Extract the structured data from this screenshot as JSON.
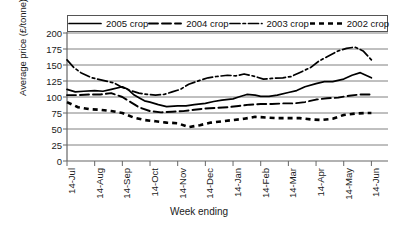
{
  "chart_data": {
    "type": "line",
    "title": "",
    "xlabel": "Week ending",
    "ylabel": "Average price (£/tonne)",
    "ylim": [
      0,
      200
    ],
    "yticks": [
      0,
      25,
      50,
      75,
      100,
      125,
      150,
      175,
      200
    ],
    "grid": true,
    "legend_position": "top",
    "categories": [
      "14-Jul",
      "14-Aug",
      "14-Sep",
      "14-Oct",
      "14-Nov",
      "14-Dec",
      "14-Jan",
      "14-Feb",
      "14-Mar",
      "14-Apr",
      "14-May",
      "14-Jun"
    ],
    "series": [
      {
        "name": "2005 crop",
        "style": "solid",
        "x": [
          0,
          0.3,
          0.6,
          1.0,
          1.3,
          1.6,
          2.0,
          2.2,
          2.4,
          2.6,
          2.8,
          3.0,
          3.3,
          3.6,
          4.0,
          4.3,
          4.6,
          5.0,
          5.3,
          5.6,
          6.0,
          6.2,
          6.5,
          6.8,
          7.0,
          7.3,
          7.6,
          8.0,
          8.3,
          8.6,
          9.0,
          9.3,
          9.6,
          10.0,
          10.3,
          10.6,
          11.0
        ],
        "values": [
          112,
          108,
          109,
          110,
          109,
          112,
          116,
          112,
          104,
          99,
          94,
          92,
          88,
          85,
          86,
          86,
          88,
          90,
          93,
          95,
          97,
          100,
          104,
          103,
          101,
          101,
          103,
          107,
          110,
          116,
          121,
          124,
          124,
          128,
          134,
          138,
          130
        ]
      },
      {
        "name": "2004 crop",
        "style": "dashed",
        "x": [
          0,
          0.4,
          0.8,
          1.2,
          1.6,
          2.0,
          2.3,
          2.6,
          3.0,
          3.4,
          3.8,
          4.2,
          4.6,
          5.0,
          5.4,
          5.8,
          6.2,
          6.6,
          7.0,
          7.4,
          7.8,
          8.2,
          8.6,
          9.0,
          9.4,
          9.8,
          10.2,
          10.6,
          11.0
        ],
        "values": [
          103,
          103,
          104,
          104,
          106,
          100,
          92,
          84,
          78,
          76,
          77,
          78,
          80,
          82,
          83,
          84,
          86,
          88,
          89,
          89,
          90,
          90,
          92,
          96,
          98,
          99,
          102,
          104,
          104
        ]
      },
      {
        "name": "2003 crop",
        "style": "dashdot",
        "x": [
          0,
          0.25,
          0.5,
          0.9,
          1.3,
          1.7,
          2.0,
          2.3,
          2.6,
          2.9,
          3.2,
          3.5,
          3.8,
          4.1,
          4.4,
          4.8,
          5.1,
          5.4,
          5.8,
          6.1,
          6.4,
          6.8,
          7.1,
          7.4,
          7.8,
          8.1,
          8.4,
          8.8,
          9.1,
          9.4,
          9.8,
          10.1,
          10.4,
          10.7,
          11.0
        ],
        "values": [
          158,
          146,
          138,
          130,
          126,
          122,
          115,
          110,
          106,
          104,
          103,
          104,
          108,
          112,
          120,
          126,
          130,
          132,
          134,
          133,
          136,
          132,
          128,
          129,
          130,
          132,
          138,
          146,
          156,
          163,
          172,
          176,
          178,
          172,
          158
        ]
      },
      {
        "name": "2002 crop",
        "style": "dotted",
        "x": [
          0,
          0.4,
          0.8,
          1.2,
          1.6,
          2.0,
          2.4,
          2.8,
          3.2,
          3.6,
          4.0,
          4.4,
          4.8,
          5.2,
          5.6,
          6.0,
          6.4,
          6.8,
          7.2,
          7.6,
          8.0,
          8.4,
          8.8,
          9.2,
          9.6,
          10.0,
          10.4,
          10.8,
          11.0
        ],
        "values": [
          92,
          84,
          81,
          80,
          78,
          75,
          68,
          64,
          62,
          60,
          59,
          53,
          56,
          60,
          62,
          64,
          66,
          69,
          68,
          67,
          67,
          67,
          65,
          64,
          66,
          72,
          74,
          75,
          75
        ]
      }
    ]
  },
  "legend": {
    "entries": [
      {
        "label": "2005 crop",
        "style": "solid"
      },
      {
        "label": "2004 crop",
        "style": "dashed"
      },
      {
        "label": "2003 crop",
        "style": "dashdot"
      },
      {
        "label": "2002 crop",
        "style": "dotted"
      }
    ]
  },
  "colors": {
    "line": "#000000",
    "grid": "#808080",
    "axis": "#666666",
    "text": "#1a1a1a"
  }
}
